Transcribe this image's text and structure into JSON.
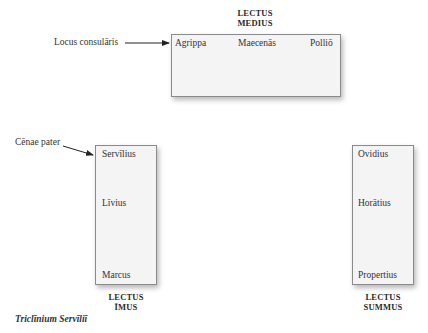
{
  "diagram": {
    "caption": "Triclīnium Servīliī",
    "couches": {
      "medius": {
        "label_line1": "LECTUS",
        "label_line2": "MEDIUS",
        "guests": [
          "Agrippa",
          "Maecenās",
          "Polliō"
        ]
      },
      "imus": {
        "label_line1": "LECTUS",
        "label_line2": "ĪMUS",
        "guests": [
          "Servīlius",
          "Līvius",
          "Marcus"
        ]
      },
      "summus": {
        "label_line1": "LECTUS",
        "label_line2": "SUMMUS",
        "guests": [
          "Ovidius",
          "Horātius",
          "Propertius"
        ]
      }
    },
    "callouts": {
      "locus_consularis": "Locus consulāris",
      "cenae_pater": "Cēnae pater"
    },
    "colors": {
      "couch_fill": "#f4f4f4",
      "couch_border": "#8a8a8a",
      "text": "#2a2a2a"
    }
  }
}
